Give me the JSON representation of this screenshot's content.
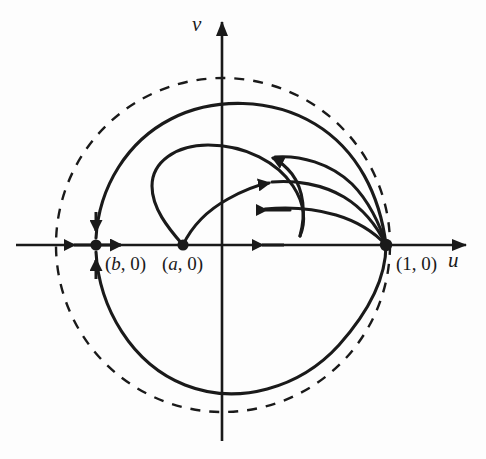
{
  "figure": {
    "background_color": "#fdfdfd",
    "stroke_color": "#1a1a1a",
    "width": 486,
    "height": 459
  },
  "axes": {
    "v_label": "v",
    "u_label": "u",
    "origin": {
      "x": 222,
      "y": 245
    },
    "v_axis": {
      "x": 222,
      "y_top": 18,
      "y_bottom": 441
    },
    "u_axis": {
      "y": 245,
      "x_left": 16,
      "x_right": 470
    }
  },
  "points": [
    {
      "name": "point-b",
      "label": "(b, 0)",
      "italic_part": "b",
      "x": 96,
      "y": 245,
      "type": "fixed-point-node"
    },
    {
      "name": "point-a",
      "label": "(a, 0)",
      "italic_part": "a",
      "x": 183,
      "y": 245,
      "type": "fixed-point-source"
    },
    {
      "name": "point-one",
      "label": "(1, 0)",
      "italic_part": "",
      "x": 386,
      "y": 245,
      "type": "fixed-point-saddle"
    }
  ],
  "dashed_circle": {
    "name": "unit-circle",
    "center_x": 223,
    "center_y": 245,
    "radius": 167,
    "dash_pattern": "10 9",
    "style": "dashed"
  },
  "chart_data": {
    "type": "line",
    "xlabel": "u",
    "ylabel": "v",
    "grid": false,
    "legend": null,
    "annotations": [
      "(b, 0)",
      "(a, 0)",
      "(1, 0)"
    ],
    "fixed_points": [
      {
        "label": "(b, 0)",
        "u": -0.76,
        "v": 0
      },
      {
        "label": "(a, 0)",
        "u": -0.24,
        "v": 0
      },
      {
        "label": "(1, 0)",
        "u": 1.0,
        "v": 0
      }
    ],
    "reference_curve": {
      "label": "unit circle",
      "style": "dashed",
      "center": [
        0,
        0
      ],
      "radius": 1.0
    },
    "trajectories": [
      {
        "name": "outer-heteroclinic-orbit",
        "from": "(1, 0)",
        "to": "(b, 0)",
        "direction": "counterclockwise",
        "closed": true
      },
      {
        "name": "interior-trajectory-1",
        "from": "(a, 0)",
        "to": "(1, 0)",
        "direction": "counterclockwise"
      },
      {
        "name": "interior-trajectory-2",
        "from": "(a, 0)",
        "to": "(1, 0)",
        "direction": "counterclockwise"
      },
      {
        "name": "interior-trajectory-3",
        "from": "(a, 0)",
        "to": "(1, 0)",
        "direction": "counterclockwise"
      },
      {
        "name": "axis-segment-a-to-one",
        "from": "(1, 0)",
        "to": "(a, 0)",
        "direction": "leftward"
      },
      {
        "name": "axis-segment-left-of-b",
        "from": "(b, 0)",
        "to": "-infinity",
        "direction": "leftward"
      },
      {
        "name": "axis-segment-b-to-a",
        "from": "(b, 0)",
        "to": "(a, 0)",
        "direction": "rightward"
      }
    ],
    "flow_arrows": [
      {
        "name": "arrow-axis-left-outer",
        "x": 78,
        "y": 245,
        "dir": "left"
      },
      {
        "name": "arrow-axis-right-of-b",
        "x": 118,
        "y": 245,
        "dir": "right"
      },
      {
        "name": "arrow-into-b-from-above",
        "x": 96,
        "y": 228,
        "dir": "down"
      },
      {
        "name": "arrow-into-b-from-below",
        "x": 96,
        "y": 262,
        "dir": "up"
      },
      {
        "name": "arrow-axis-toward-a",
        "x": 268,
        "y": 245,
        "dir": "left"
      },
      {
        "name": "arrow-interior-top",
        "x": 272,
        "y": 158,
        "dir": "upleft"
      },
      {
        "name": "arrow-interior-middle",
        "x": 269,
        "y": 183,
        "dir": "upleft"
      },
      {
        "name": "arrow-interior-bottom",
        "x": 262,
        "y": 210,
        "dir": "left"
      }
    ]
  }
}
